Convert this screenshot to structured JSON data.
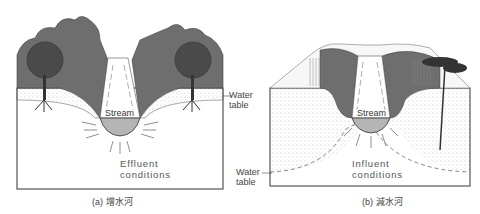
{
  "panels": [
    {
      "id": "a",
      "caption": "(a) 增水河",
      "stream_label": "Stream",
      "condition_line1": "Effluent",
      "condition_line2": "conditions",
      "water_table_line1": "Water",
      "water_table_line2": "table",
      "flow_direction": "toward-stream"
    },
    {
      "id": "b",
      "caption": "(b) 減水河",
      "stream_label": "Stream",
      "condition_line1": "Influent",
      "condition_line2": "conditions",
      "water_table_line1": "Water",
      "water_table_line2": "table",
      "flow_direction": "away-from-stream"
    }
  ],
  "colors": {
    "foliage": "#6e6e6e",
    "foliage_dark": "#4a4a4a",
    "stream_water": "#b5b5b5",
    "outline": "#333333",
    "sand": "#f2f2ee"
  }
}
